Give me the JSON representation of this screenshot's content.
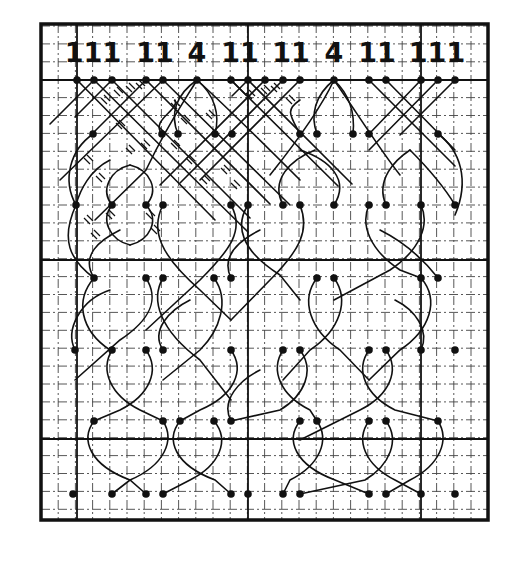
{
  "diagram": {
    "type": "bobbin-lace-pricking",
    "colors": {
      "ink": "#111111",
      "grid_minor": "#444444",
      "background": "#ffffff"
    },
    "frame": {
      "x": 41,
      "y": 24,
      "width": 447,
      "height": 496
    },
    "grid": {
      "cell_w": 17.2,
      "cell_h": 17.9,
      "origin_x": 41,
      "origin_y": 26,
      "cols": 26,
      "rows": 28,
      "major_x": [
        77,
        248,
        421
      ],
      "major_y": [
        80,
        260,
        439
      ]
    },
    "pair_labels": [
      {
        "text": "111",
        "x": 93
      },
      {
        "text": "11",
        "x": 155
      },
      {
        "text": "4",
        "x": 197
      },
      {
        "text": "11",
        "x": 240
      },
      {
        "text": "11",
        "x": 291
      },
      {
        "text": "4",
        "x": 334
      },
      {
        "text": "11",
        "x": 377
      },
      {
        "text": "111",
        "x": 437
      }
    ],
    "label_y": 62,
    "pin_rows": [
      {
        "y": 80,
        "x": [
          77,
          94,
          112,
          146,
          163,
          197,
          231,
          248,
          265,
          283,
          300,
          334,
          369,
          386,
          421,
          438,
          455
        ]
      },
      {
        "y": 134,
        "x": [
          93,
          162,
          178,
          215,
          232,
          300,
          317,
          353,
          369,
          438
        ]
      },
      {
        "y": 205,
        "x": [
          76,
          112,
          146,
          163,
          231,
          248,
          283,
          300,
          334,
          369,
          386,
          421,
          455
        ]
      },
      {
        "y": 278,
        "x": [
          94,
          146,
          163,
          214,
          231,
          317,
          334,
          421,
          438
        ]
      },
      {
        "y": 350,
        "x": [
          75,
          112,
          146,
          163,
          231,
          283,
          300,
          369,
          386,
          421,
          455
        ]
      },
      {
        "y": 421,
        "x": [
          94,
          163,
          180,
          214,
          231,
          300,
          317,
          369,
          386,
          438
        ]
      },
      {
        "y": 494,
        "x": [
          73,
          112,
          146,
          163,
          231,
          248,
          283,
          300,
          369,
          386,
          421,
          455
        ]
      }
    ],
    "threads": [
      "M77 80 L215 220",
      "M94 80 L248 232",
      "M112 80 L75 117",
      "M146 80 L95 131",
      "M163 80 L290 205",
      "M112 80 L250 218",
      "M146 80 L270 204",
      "M163 80 L60 180",
      "M94 80 L50 124",
      "M77 80 L75 82",
      "M197 80 C175 95 170 115 178 134",
      "M197 80 C215 95 220 115 215 134",
      "M197 80 C185 100 170 120 146 170 L95 220",
      "M197 80 C230 110 260 140 300 180",
      "M231 80 L338 186",
      "M248 80 L352 184",
      "M265 80 L160 185",
      "M283 80 L180 183",
      "M300 80 L200 180",
      "M231 80 L246 95",
      "M248 80 L232 96",
      "M334 80 C315 95 310 115 317 134",
      "M334 80 C350 95 355 115 353 134",
      "M334 80 C320 110 290 150 270 175",
      "M334 80 C355 110 380 150 400 175",
      "M369 80 L455 166",
      "M386 80 L455 150",
      "M421 80 L369 134",
      "M438 80 L369 150",
      "M455 80 L400 135",
      "M93 134 C70 150 62 180 76 205",
      "M438 134 C460 150 470 180 455 215",
      "M162 134 C150 120 180 110 175 100",
      "M300 134 C290 115 285 110 300 100",
      "M76 205 C60 240 70 260 94 278",
      "M76 205 C80 190 90 170 110 160",
      "M112 205 C100 190 110 170 130 165",
      "M146 205 C160 190 150 170 130 165",
      "M112 205 C100 220 110 240 130 245",
      "M146 205 C160 220 150 240 130 245",
      "M163 205 C150 230 160 255 200 290 L231 320",
      "M231 205 C245 230 230 250 200 280 L146 330",
      "M248 205 C235 225 240 250 280 275 L300 300",
      "M300 205 C310 230 300 250 270 280 L231 320",
      "M283 205 C270 180 290 160 315 150",
      "M334 205 C350 180 330 160 300 150",
      "M369 205 C360 225 370 250 400 270 L421 278",
      "M421 205 C430 225 420 250 390 270 L334 300",
      "M386 205 C375 180 395 160 410 150",
      "M455 205 C440 180 420 160 410 150",
      "M94 278 C75 300 80 330 110 350",
      "M94 278 C80 255 100 240 120 230",
      "M146 278 C160 300 150 320 120 340 L75 380",
      "M163 278 C150 300 160 330 200 360 L231 400",
      "M214 278 C230 300 220 330 200 350 L163 380",
      "M231 278 C220 255 240 240 260 230",
      "M317 278 C300 300 310 330 340 350 L369 380",
      "M334 278 C350 300 340 330 310 350 L283 380",
      "M421 278 C440 300 430 330 400 350 L369 380",
      "M438 278 C420 255 400 240 380 230",
      "M75 350 C65 330 80 300 110 290",
      "M112 350 C100 370 110 395 140 410 L163 421",
      "M146 350 C160 370 150 395 120 410 L94 421",
      "M163 350 C150 330 170 310 190 300",
      "M231 350 C245 370 235 395 200 410 L180 421",
      "M283 350 C270 370 280 395 310 410 L317 421",
      "M300 350 C315 370 305 395 280 410 L231 421",
      "M369 350 C355 370 365 395 395 410 L438 421",
      "M386 350 C400 370 390 395 360 410 L300 440",
      "M421 350 C430 330 415 310 395 300",
      "M94 421 C80 440 90 465 130 480 L146 494",
      "M163 421 C175 440 165 465 130 480 L112 494",
      "M180 421 C165 440 175 465 215 480 L231 494",
      "M214 421 C230 440 220 465 190 480 L163 494",
      "M231 421 C220 400 240 380 260 370",
      "M300 421 C285 440 295 465 335 480 L369 494",
      "M317 421 C330 440 320 465 290 480 L283 494",
      "M369 421 C355 440 365 465 395 480 L421 494",
      "M386 421 C400 440 390 465 365 480 L300 494",
      "M438 421 C450 440 440 465 410 480 L386 494"
    ],
    "tally_marks": [
      [
        105,
        100
      ],
      [
        118,
        92
      ],
      [
        130,
        88
      ],
      [
        140,
        85
      ],
      [
        175,
        105
      ],
      [
        120,
        125
      ],
      [
        88,
        160
      ],
      [
        100,
        178
      ],
      [
        130,
        150
      ],
      [
        145,
        145
      ],
      [
        175,
        145
      ],
      [
        190,
        160
      ],
      [
        205,
        180
      ],
      [
        225,
        170
      ],
      [
        235,
        185
      ],
      [
        110,
        215
      ],
      [
        150,
        215
      ],
      [
        88,
        220
      ],
      [
        95,
        235
      ],
      [
        155,
        230
      ],
      [
        185,
        120
      ],
      [
        210,
        115
      ],
      [
        250,
        95
      ],
      [
        265,
        90
      ],
      [
        275,
        88
      ],
      [
        290,
        100
      ]
    ]
  }
}
